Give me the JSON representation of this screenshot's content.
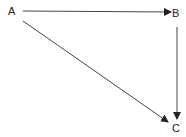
{
  "diagram": {
    "nodes": [
      {
        "id": "A",
        "label": "A"
      },
      {
        "id": "B",
        "label": "B"
      },
      {
        "id": "C",
        "label": "C"
      }
    ],
    "edges": [
      {
        "from": "A",
        "to": "B"
      },
      {
        "from": "A",
        "to": "C"
      },
      {
        "from": "B",
        "to": "C"
      }
    ],
    "colors": {
      "line": "#333333",
      "text": "#222222",
      "background": "#ffffff"
    }
  }
}
